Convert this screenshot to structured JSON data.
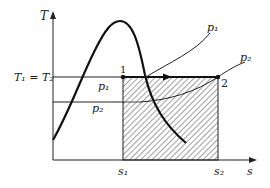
{
  "diagram": {
    "type": "T-s diagram",
    "axes": {
      "y_label": "T",
      "x_label": "s"
    },
    "temperature_label": "T₁ = T₂",
    "pressure_labels": {
      "p1_curve": "p₁",
      "p2_curve": "p₂",
      "p1_line": "p₁",
      "p2_line": "p₂"
    },
    "points": {
      "point1": "1",
      "point2": "2"
    },
    "entropy_ticks": {
      "s1": "s₁",
      "s2": "s₂"
    },
    "colors": {
      "ink": "#222222",
      "background": "#ffffff"
    }
  }
}
